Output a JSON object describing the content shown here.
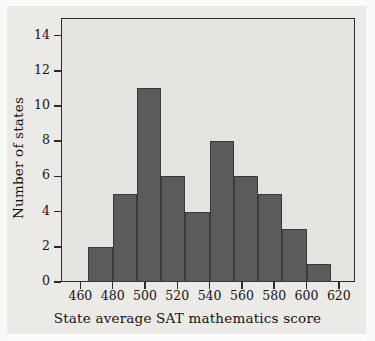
{
  "chart_data": {
    "type": "bar",
    "title": "",
    "subtitle": "",
    "xlabel": "State average SAT mathematics score",
    "ylabel": "Number of states",
    "xlim": [
      448,
      630
    ],
    "ylim": [
      0,
      15
    ],
    "grid": false,
    "legend": null,
    "bin_width": 15,
    "bin_edges": [
      465,
      480,
      495,
      510,
      525,
      540,
      555,
      570,
      585,
      600,
      615
    ],
    "categories": [
      "465-480",
      "480-495",
      "495-510",
      "510-525",
      "525-540",
      "540-555",
      "555-570",
      "570-585",
      "585-600",
      "600-615"
    ],
    "values": [
      2,
      5,
      11,
      6,
      4,
      8,
      6,
      5,
      3,
      1
    ],
    "x_ticks": [
      460,
      480,
      500,
      520,
      540,
      560,
      580,
      600,
      620
    ],
    "x_tick_labels": [
      "460",
      "480",
      "500",
      "520",
      "540",
      "560",
      "580",
      "600",
      "620"
    ],
    "y_ticks": [
      0,
      2,
      4,
      6,
      8,
      10,
      12,
      14
    ],
    "y_tick_labels": [
      "0",
      "2",
      "4",
      "6",
      "8",
      "10",
      "12",
      "14"
    ],
    "colors": {
      "bar_fill": "#5b5b5b",
      "bar_edge": "#3a3a3a",
      "plot_background": "#e4e3df",
      "figure_background": "#eceae6",
      "axis": "#2b2b2b",
      "text": "#141414"
    }
  }
}
